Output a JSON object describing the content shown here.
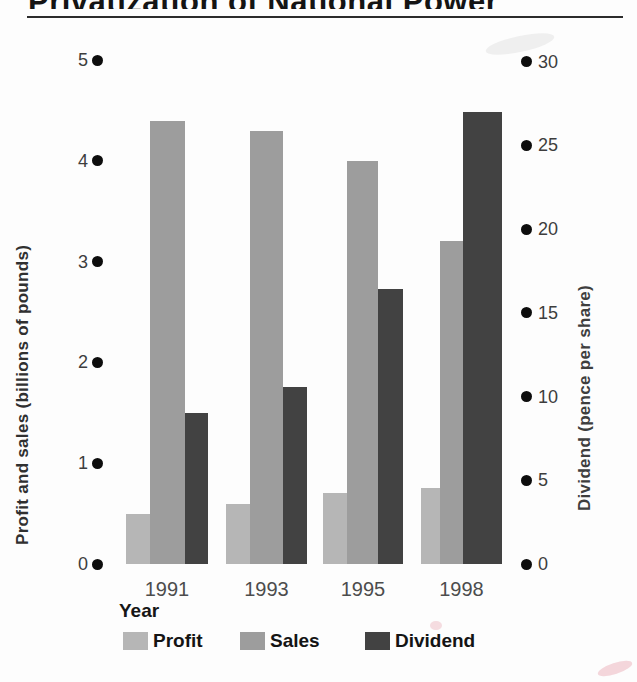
{
  "page": {
    "background": "#fdfdfd"
  },
  "chart_data": {
    "type": "bar",
    "title": "Privatization of National Power",
    "title_note": "title partially cut off at top edge of scan",
    "categories": [
      "1991",
      "1993",
      "1995",
      "1998"
    ],
    "xlabel": "Year",
    "left_axis": {
      "label": "Profit and sales (billions of pounds)",
      "ticks": [
        0,
        1,
        2,
        3,
        4,
        5
      ],
      "range": [
        0,
        5
      ]
    },
    "right_axis": {
      "label": "Dividend (pence per share)",
      "ticks": [
        0,
        5,
        10,
        15,
        20,
        25,
        30
      ],
      "range": [
        0,
        30
      ]
    },
    "series": [
      {
        "name": "Profit",
        "axis": "left",
        "color": "#b6b6b6",
        "values": [
          0.5,
          0.6,
          0.7,
          0.75
        ]
      },
      {
        "name": "Sales",
        "axis": "left",
        "color": "#9d9d9d",
        "values": [
          4.4,
          4.3,
          4.0,
          3.2
        ]
      },
      {
        "name": "Dividend",
        "axis": "right",
        "color": "#424242",
        "values": [
          9,
          10.6,
          16.4,
          27
        ]
      }
    ],
    "legend": [
      "Profit",
      "Sales",
      "Dividend"
    ],
    "legend_position": "bottom",
    "grid": false,
    "tick_marker": "filled-circle",
    "tick_marker_color": "#0d0d0d"
  }
}
